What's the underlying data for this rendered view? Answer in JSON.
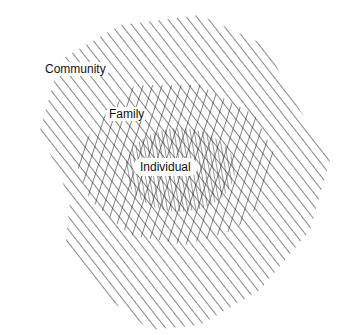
{
  "diagram": {
    "type": "nested-hatched-regions",
    "regions": [
      {
        "id": "community",
        "label": "Community",
        "hatch": "single-diagonal",
        "order": "outer"
      },
      {
        "id": "family",
        "label": "Family",
        "hatch": "cross-hatch",
        "order": "middle"
      },
      {
        "id": "individual",
        "label": "Individual",
        "hatch": "dense-cross-hatch",
        "order": "inner"
      }
    ],
    "colors": {
      "line": "#222222",
      "background": "#ffffff"
    }
  }
}
